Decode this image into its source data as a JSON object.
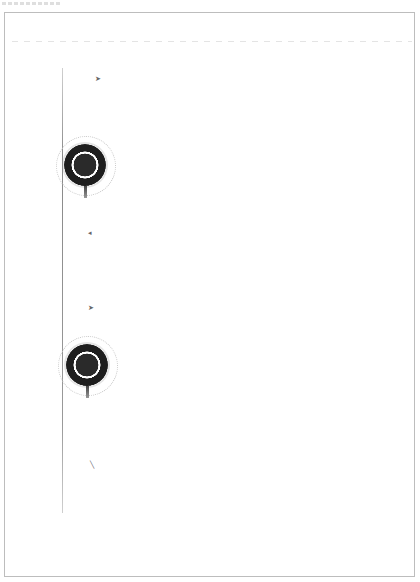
{
  "document": {
    "type": "scanned-page",
    "frame": {
      "border_color": "#bdbdbd",
      "background": "#ffffff"
    },
    "seals": [
      {
        "name": "seal-1",
        "color": "#1e1e1e"
      },
      {
        "name": "seal-2",
        "color": "#1e1e1e"
      }
    ],
    "margin_marks": 4
  }
}
